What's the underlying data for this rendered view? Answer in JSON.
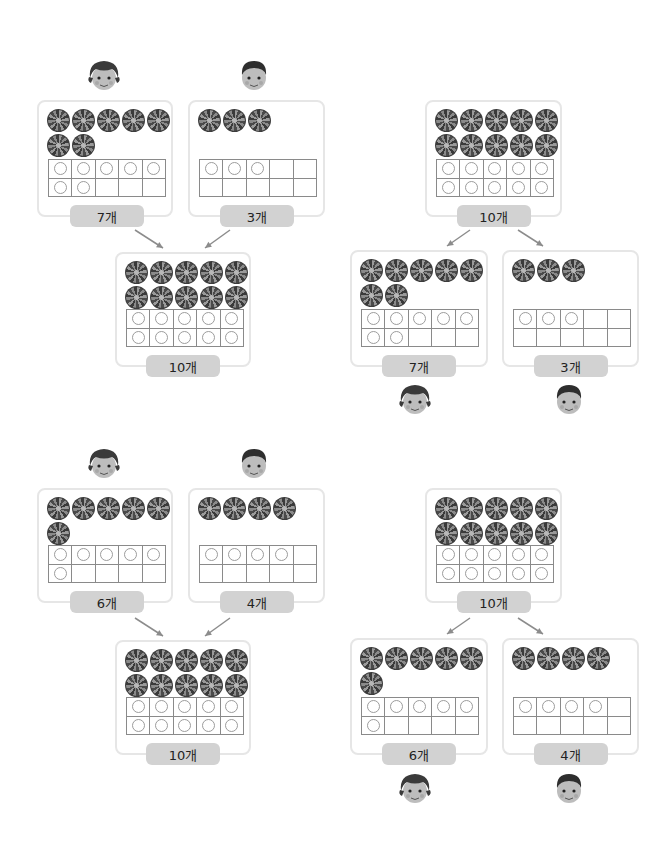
{
  "panels": [
    {
      "id": "top-left-merge",
      "type": "combine",
      "girl": {
        "label": "7개",
        "count": 7
      },
      "boy": {
        "label": "3개",
        "count": 3
      },
      "total": {
        "label": "10개",
        "count": 10
      }
    },
    {
      "id": "top-right-split",
      "type": "split",
      "total": {
        "label": "10개",
        "count": 10
      },
      "girl": {
        "label": "7개",
        "count": 7
      },
      "boy": {
        "label": "3개",
        "count": 3
      }
    },
    {
      "id": "bottom-left-merge",
      "type": "combine",
      "girl": {
        "label": "6개",
        "count": 6
      },
      "boy": {
        "label": "4개",
        "count": 4
      },
      "total": {
        "label": "10개",
        "count": 10
      }
    },
    {
      "id": "bottom-right-split",
      "type": "split",
      "total": {
        "label": "10개",
        "count": 10
      },
      "girl": {
        "label": "6개",
        "count": 6
      },
      "boy": {
        "label": "4개",
        "count": 4
      }
    }
  ],
  "colors": {
    "card_border": "#e6e6e6",
    "label_bg": "#d2d2d2",
    "grid_line": "#8a8a8a",
    "arrow": "#8c8c8c"
  },
  "icons": {
    "candy": "swirl-candy-icon",
    "girl": "girl-face-icon",
    "boy": "boy-face-icon",
    "counter": "circle-counter-icon"
  }
}
